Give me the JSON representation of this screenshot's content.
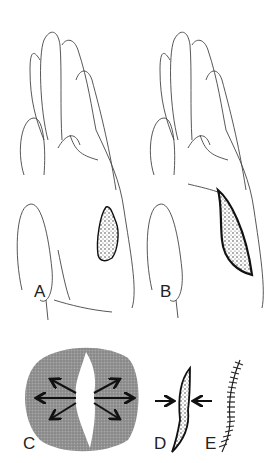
{
  "figure": {
    "panels": [
      {
        "id": "A",
        "label": "A",
        "description": "Palmar hand with irregular stippled wound on hypothenar region"
      },
      {
        "id": "B",
        "label": "B",
        "description": "Palmar hand with wound excised into an elliptical (fusiform) defect"
      },
      {
        "id": "C",
        "label": "C",
        "description": "Undermining of skin around defect; arrows radiating outward"
      },
      {
        "id": "D",
        "label": "D",
        "description": "Elliptical defect with arrows pushing edges together"
      },
      {
        "id": "E",
        "label": "E",
        "description": "Closed curved incision with sutures"
      }
    ],
    "top_caption_cropped": "",
    "colors": {
      "line": "#333333",
      "stipple_dark": "#1a1a1a",
      "undermine_fill": "#8c8c8c",
      "background": "#ffffff"
    },
    "arrows_c_count": 6,
    "arrows_d_count": 2,
    "sutures_e_count": 18
  }
}
